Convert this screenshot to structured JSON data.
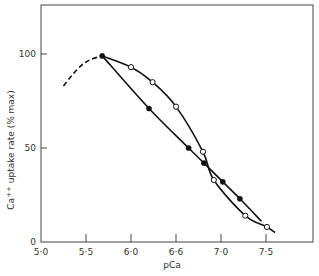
{
  "chart_data": {
    "type": "line",
    "title": "",
    "xlabel": "pCa",
    "ylabel": "Ca++ uptake rate (% max)",
    "ylabel_parts": {
      "pre": "Ca",
      "sup": "++",
      "post": " uptake rate (% max)"
    },
    "xlim": [
      5.0,
      8.0
    ],
    "ylim": [
      0,
      120
    ],
    "x_ticks": [
      {
        "value": 5.0,
        "label": "5·0"
      },
      {
        "value": 5.5,
        "label": "5·5"
      },
      {
        "value": 6.0,
        "label": "6·0"
      },
      {
        "value": 6.5,
        "label": "6·6"
      },
      {
        "value": 7.0,
        "label": "7·0"
      },
      {
        "value": 7.5,
        "label": "7·5"
      }
    ],
    "y_ticks": [
      {
        "value": 0,
        "label": "0"
      },
      {
        "value": 50,
        "label": "50"
      },
      {
        "value": 100,
        "label": "100"
      }
    ],
    "grid": false,
    "series": [
      {
        "name": "extrapolated (dashed)",
        "marker": "none",
        "style": "dashed",
        "x": [
          5.25,
          5.35,
          5.45,
          5.55,
          5.68
        ],
        "y": [
          83,
          89,
          94,
          97,
          99
        ]
      },
      {
        "name": "open circles",
        "marker": "open-circle",
        "style": "solid",
        "x": [
          5.68,
          6.0,
          6.24,
          6.5,
          6.8,
          6.92,
          7.27,
          7.51
        ],
        "y": [
          99,
          93,
          85,
          72,
          48,
          33,
          14,
          8
        ],
        "curve_end": [
          7.6,
          5
        ]
      },
      {
        "name": "filled circles",
        "marker": "filled-circle",
        "style": "solid",
        "x": [
          5.68,
          6.2,
          6.64,
          6.81,
          7.02,
          7.21
        ],
        "y": [
          99,
          71,
          50,
          42,
          32,
          23
        ],
        "curve_end": [
          7.45,
          11
        ]
      }
    ]
  }
}
